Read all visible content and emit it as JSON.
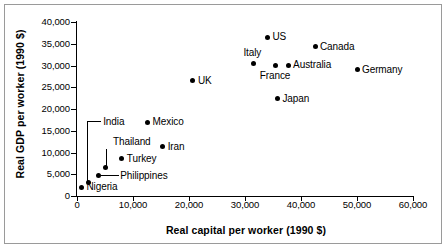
{
  "chart_data": {
    "type": "scatter",
    "title": "",
    "xlabel": "Real capital per worker (1990 $)",
    "ylabel": "Real GDP per worker (1990 $)",
    "xlim": [
      0,
      60000
    ],
    "ylim": [
      0,
      40000
    ],
    "xticks": [
      "0",
      "10,000",
      "20,000",
      "30,000",
      "40,000",
      "50,000",
      "60,000"
    ],
    "xtick_values": [
      0,
      10000,
      20000,
      30000,
      40000,
      50000,
      60000
    ],
    "yticks": [
      "0",
      "5,000",
      "10,000",
      "15,000",
      "20,000",
      "25,000",
      "30,000",
      "35,000",
      "40,000"
    ],
    "ytick_values": [
      0,
      5000,
      10000,
      15000,
      20000,
      25000,
      30000,
      35000,
      40000
    ],
    "grid": false,
    "legend": false,
    "points": [
      {
        "name": "US",
        "x": 34000,
        "y": 36500,
        "label": "US",
        "label_pos": "right"
      },
      {
        "name": "Canada",
        "x": 42500,
        "y": 34300,
        "label": "Canada",
        "label_pos": "right"
      },
      {
        "name": "Italy",
        "x": 31500,
        "y": 30500,
        "label": "Italy",
        "label_pos": "above-left"
      },
      {
        "name": "France",
        "x": 35500,
        "y": 30100,
        "label": "France",
        "label_pos": "below"
      },
      {
        "name": "Australia",
        "x": 37700,
        "y": 30100,
        "label": "Australia",
        "label_pos": "right"
      },
      {
        "name": "Germany",
        "x": 50000,
        "y": 29000,
        "label": "Germany",
        "label_pos": "right"
      },
      {
        "name": "UK",
        "x": 20700,
        "y": 26500,
        "label": "UK",
        "label_pos": "right"
      },
      {
        "name": "Japan",
        "x": 35800,
        "y": 22300,
        "label": "Japan",
        "label_pos": "right"
      },
      {
        "name": "Mexico",
        "x": 12600,
        "y": 16900,
        "label": "Mexico",
        "label_pos": "right"
      },
      {
        "name": "Iran",
        "x": 15300,
        "y": 11300,
        "label": "Iran",
        "label_pos": "right"
      },
      {
        "name": "Turkey",
        "x": 8000,
        "y": 8600,
        "label": "Turkey",
        "label_pos": "right"
      },
      {
        "name": "Thailand",
        "x": 5000,
        "y": 6600,
        "label": "Thailand",
        "label_pos": "leader-up"
      },
      {
        "name": "Philippines",
        "x": 3800,
        "y": 4700,
        "label": "Philippines",
        "label_pos": "leader-right"
      },
      {
        "name": "India",
        "x": 2000,
        "y": 3100,
        "label": "India",
        "label_pos": "leader-elbow"
      },
      {
        "name": "Nigeria",
        "x": 800,
        "y": 2000,
        "label": "Nigeria",
        "label_pos": "right"
      }
    ]
  },
  "colors": {
    "point": "#000000",
    "axis": "#000000",
    "frame": "#9a9a9a",
    "background": "#ffffff"
  }
}
